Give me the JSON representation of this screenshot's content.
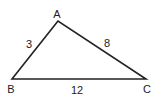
{
  "diagram": {
    "type": "triangle",
    "stroke_color": "#222222",
    "vertices": [
      {
        "label": "A",
        "x": 58,
        "y": 21
      },
      {
        "label": "B",
        "x": 12,
        "y": 79
      },
      {
        "label": "C",
        "x": 146,
        "y": 79
      }
    ],
    "sides": [
      {
        "between": "AB",
        "length_label": "3"
      },
      {
        "between": "AC",
        "length_label": "8"
      },
      {
        "between": "BC",
        "length_label": "12"
      }
    ]
  }
}
